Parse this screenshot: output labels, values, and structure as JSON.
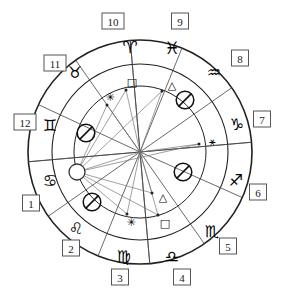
{
  "diagram": {
    "type": "natal-chart",
    "geometry": {
      "center_x": 140,
      "center_y": 152,
      "radius_outer": 112,
      "radius_zodiac_inner": 88,
      "radius_house_inner": 66
    },
    "houses": [
      {
        "number": "1",
        "label_x": 31,
        "label_y": 203,
        "cusp_angle": 185
      },
      {
        "number": "2",
        "label_x": 71,
        "label_y": 248,
        "cusp_angle": 215
      },
      {
        "number": "3",
        "label_x": 120,
        "label_y": 277,
        "cusp_angle": 248
      },
      {
        "number": "4",
        "label_x": 182,
        "label_y": 277,
        "cusp_angle": 275
      },
      {
        "number": "5",
        "label_x": 228,
        "label_y": 246,
        "cusp_angle": 305
      },
      {
        "number": "6",
        "label_x": 258,
        "label_y": 192,
        "cusp_angle": 336
      },
      {
        "number": "7",
        "label_x": 262,
        "label_y": 119,
        "cusp_angle": 5
      },
      {
        "number": "8",
        "label_x": 240,
        "label_y": 58,
        "cusp_angle": 35
      },
      {
        "number": "9",
        "label_x": 180,
        "label_y": 21,
        "cusp_angle": 68
      },
      {
        "number": "10",
        "label_x": 113,
        "label_y": 21,
        "cusp_angle": 95
      },
      {
        "number": "11",
        "label_x": 55,
        "label_y": 63,
        "cusp_angle": 125
      },
      {
        "number": "12",
        "label_x": 25,
        "label_y": 122,
        "cusp_angle": 155
      }
    ],
    "zodiac_signs": [
      {
        "name": "aries",
        "glyph": "♈",
        "x": 130,
        "y": 47,
        "size": 17
      },
      {
        "name": "pisces",
        "glyph": "♓",
        "x": 172,
        "y": 48,
        "size": 17
      },
      {
        "name": "aquarius",
        "glyph": "♒",
        "x": 214,
        "y": 72,
        "size": 16
      },
      {
        "name": "capricorn",
        "glyph": "♑",
        "x": 237,
        "y": 124,
        "size": 16
      },
      {
        "name": "sagittarius",
        "glyph": "♐",
        "x": 236,
        "y": 180,
        "size": 16
      },
      {
        "name": "scorpio",
        "glyph": "♏",
        "x": 212,
        "y": 231,
        "size": 16
      },
      {
        "name": "libra",
        "glyph": "♎",
        "x": 172,
        "y": 256,
        "size": 16
      },
      {
        "name": "virgo",
        "glyph": "♍",
        "x": 124,
        "y": 256,
        "size": 16
      },
      {
        "name": "leo",
        "glyph": "♌",
        "x": 76,
        "y": 228,
        "size": 16
      },
      {
        "name": "cancer",
        "glyph": "♋",
        "x": 50,
        "y": 180,
        "size": 16
      },
      {
        "name": "gemini",
        "glyph": "♊",
        "x": 50,
        "y": 125,
        "size": 16
      },
      {
        "name": "taurus",
        "glyph": "♉",
        "x": 75,
        "y": 72,
        "size": 16
      }
    ],
    "planet_markers": [
      {
        "name": "marker-upper-right",
        "glyph": "⃠",
        "x": 185,
        "y": 100,
        "size": 20
      },
      {
        "name": "marker-lower-right",
        "glyph": "⃠",
        "x": 183,
        "y": 172,
        "size": 20
      },
      {
        "name": "marker-lower-left",
        "glyph": "⃠",
        "x": 92,
        "y": 202,
        "size": 20
      },
      {
        "name": "marker-upper-left",
        "glyph": "⃠",
        "x": 86,
        "y": 133,
        "size": 20
      }
    ],
    "aspect_markers": [
      {
        "name": "square-upper",
        "glyph": "□",
        "x": 132,
        "y": 82,
        "size": 11,
        "dot_x": 126,
        "dot_y": 90
      },
      {
        "name": "sextile-upper",
        "glyph": "✳",
        "x": 110,
        "y": 97,
        "size": 11,
        "dot_x": 107,
        "dot_y": 105
      },
      {
        "name": "trine-upper",
        "glyph": "△",
        "x": 172,
        "y": 85,
        "size": 11,
        "dot_x": 162,
        "dot_y": 91
      },
      {
        "name": "trine-lower",
        "glyph": "△",
        "x": 163,
        "y": 197,
        "size": 11,
        "dot_x": 152,
        "dot_y": 193
      },
      {
        "name": "square-lower",
        "glyph": "□",
        "x": 165,
        "y": 223,
        "size": 11,
        "dot_x": 158,
        "dot_y": 215
      },
      {
        "name": "sextile-lower",
        "glyph": "✳",
        "x": 131,
        "y": 222,
        "size": 11,
        "dot_x": 127,
        "dot_y": 214
      },
      {
        "name": "node-right",
        "glyph": "⚹",
        "x": 212,
        "y": 141,
        "size": 11,
        "dot_x": 199,
        "dot_y": 144
      }
    ],
    "ascendant": {
      "name": "ascendant-body",
      "x": 77,
      "y": 172,
      "radius": 8
    },
    "aspect_lines_from_ascendant": [
      {
        "to_x": 126,
        "to_y": 90
      },
      {
        "to_x": 107,
        "to_y": 105
      },
      {
        "to_x": 162,
        "to_y": 91
      },
      {
        "to_x": 152,
        "to_y": 193
      },
      {
        "to_x": 158,
        "to_y": 215
      },
      {
        "to_x": 127,
        "to_y": 214
      },
      {
        "to_x": 199,
        "to_y": 144
      },
      {
        "to_x": 140,
        "to_y": 152
      }
    ],
    "aspect_lines_from_center": [
      {
        "to_x": 126,
        "to_y": 90
      },
      {
        "to_x": 107,
        "to_y": 105
      },
      {
        "to_x": 162,
        "to_y": 91
      },
      {
        "to_x": 152,
        "to_y": 193
      },
      {
        "to_x": 158,
        "to_y": 215
      },
      {
        "to_x": 127,
        "to_y": 214
      },
      {
        "to_x": 199,
        "to_y": 144
      }
    ],
    "colors": {
      "ink": "#222222",
      "spoke": "#444444",
      "aspect": "#777777",
      "box_border": "#555555",
      "background": "#ffffff"
    }
  }
}
